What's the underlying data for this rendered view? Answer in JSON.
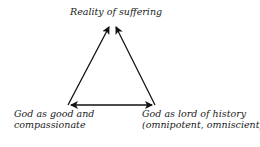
{
  "diagram": {
    "nodes": {
      "top": {
        "label": "Reality of suffering"
      },
      "left": {
        "line1": "God as good and",
        "line2": "compassionate"
      },
      "right": {
        "line1": "God as lord of history",
        "line2": "(omnipotent, omniscient)"
      }
    },
    "edges": [
      {
        "from": "left",
        "to": "top",
        "type": "single-arrow"
      },
      {
        "from": "right",
        "to": "top",
        "type": "single-arrow"
      },
      {
        "from": "left",
        "to": "right",
        "type": "double-arrow"
      }
    ],
    "colors": {
      "line": "#111111",
      "text": "#1a1a1a"
    }
  }
}
